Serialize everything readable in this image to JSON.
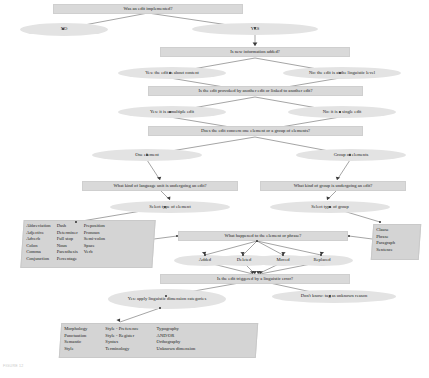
{
  "figure": {
    "caption": "FIGURE 12"
  },
  "colors": {
    "rect_fill": "#d9d9d9",
    "ellipse_fill": "#e3e3e3",
    "list_fill": "#d4d4d4",
    "edge": "#4a4a4a",
    "text": "#1c1c1c"
  },
  "nodes": {
    "q_edit_implemented": "Was an edit implemented?",
    "a_no": "NO",
    "a_yes": "YES",
    "q_new_info": "Is new information added?",
    "a_content": "Yes: the edit is about content",
    "a_linguistic": "No: the edit is at the linguistic level",
    "q_provoked": "Is the edit provoked by another edit or linked to another edit?",
    "a_multiple": "Yes: it is a multiple edit",
    "a_single": "No: it is a single edit",
    "q_one_or_group": "Does the edit concern one element or a group of elements?",
    "a_one_element": "One element",
    "a_group_elements": "Group of elements",
    "q_language_unit": "What kind of language unit is undergoing an edit?",
    "q_kind_of_group": "What kind of group is undergoing an edit?",
    "a_select_element": "Select type of element",
    "a_select_group": "Select type of group",
    "q_what_happened": "What happened to the element or phrase?",
    "a_added": "Added",
    "a_deleted": "Deleted",
    "a_moved": "Moved",
    "a_replaced": "Replaced",
    "q_linguistic_error": "Is the edit triggered by a linguistic error?",
    "a_apply_dimensions": "Yes: apply linguistic dimension categories",
    "a_dont_know": "Don't know: tag as unknown reason"
  },
  "element_types": {
    "col1": [
      "Abbreviation",
      "Adjective",
      "Adverb",
      "Colon",
      "Comma",
      "Conjunction"
    ],
    "col2": [
      "Dash",
      "Determiner",
      "Full stop",
      "Noun",
      "Parenthesis",
      "Percentage"
    ],
    "col3": [
      "Preposition",
      "Pronoun",
      "Semi-colon",
      "Space",
      "Verb"
    ]
  },
  "group_types": {
    "col1": [
      "Clause",
      "Phrase",
      "Paragraph",
      "Sentence"
    ]
  },
  "dimension_categories": {
    "col1": [
      "Morphology",
      "Punctuation",
      "Semantic",
      "Style"
    ],
    "col2": [
      "Style - Preference",
      "Style - Register",
      "Syntax",
      "Terminology"
    ],
    "col3": [
      "Typography",
      "AND/OR",
      "Orthography",
      "Unknown dimension"
    ]
  }
}
